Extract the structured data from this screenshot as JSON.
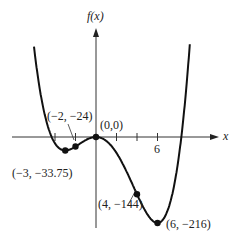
{
  "chart_data": {
    "type": "line",
    "title": "",
    "function": "f(x) = 0.25x^4 - x^3 - 9x^2",
    "xlabel": "x",
    "ylabel": "f(x)",
    "x_tick_label": "6",
    "x_ticks": [
      -4,
      -2,
      0,
      2,
      4,
      6
    ],
    "xlim": [
      -8.2,
      10.5
    ],
    "ylim": [
      -230,
      330
    ],
    "grid": false,
    "legend": null,
    "points": [
      {
        "x": -3,
        "y": -33.75,
        "label": "(−3, −33.75)"
      },
      {
        "x": -2,
        "y": -24,
        "label": "(−2, −24)"
      },
      {
        "x": 0,
        "y": 0,
        "label": "(0,0)"
      },
      {
        "x": 4,
        "y": -144,
        "label": "(4, −144)"
      },
      {
        "x": 6,
        "y": -216,
        "label": "(6, −216)"
      }
    ]
  },
  "labels": {
    "y_axis": "f(x)",
    "x_axis": "x",
    "tick6": "6",
    "p_m3": "(−3, −33.75)",
    "p_m2": "(−2, −24)",
    "p_0": "(0,0)",
    "p_4": "(4, −144)",
    "p_6": "(6, −216)"
  }
}
